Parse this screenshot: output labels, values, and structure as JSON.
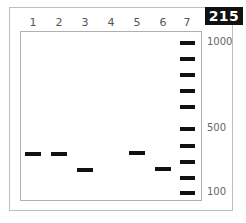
{
  "figure": {
    "badge": "215",
    "lanes": [
      {
        "label": "1",
        "x": 33
      },
      {
        "label": "2",
        "x": 59
      },
      {
        "label": "3",
        "x": 85
      },
      {
        "label": "4",
        "x": 111
      },
      {
        "label": "5",
        "x": 137
      },
      {
        "label": "6",
        "x": 163
      },
      {
        "label": "7",
        "x": 187
      }
    ],
    "sample_bands": [
      {
        "lane": "1",
        "y": 152
      },
      {
        "lane": "2",
        "y": 152
      },
      {
        "lane": "3",
        "y": 168
      },
      {
        "lane": "5",
        "y": 151
      },
      {
        "lane": "6",
        "y": 167
      }
    ],
    "ladder_bands_y": [
      41,
      57,
      73,
      89,
      105,
      127,
      144,
      160,
      176,
      191
    ],
    "size_labels": [
      {
        "text": "1000",
        "y": 36
      },
      {
        "text": "500",
        "y": 122
      },
      {
        "text": "100",
        "y": 186
      }
    ]
  }
}
